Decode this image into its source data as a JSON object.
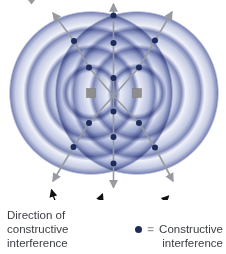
{
  "labels": {
    "direction": {
      "line1": "Direction of",
      "line2": "constructive",
      "line3": "interference"
    },
    "legend": {
      "equals": "=",
      "line1": "Constructive",
      "line2": "interference"
    }
  },
  "diagram": {
    "background": "#ffffff",
    "wave_ring_color": "#7e88b8",
    "wave_band_light": "#f0f2f9",
    "wave_band_mid": "#c3cae3",
    "arrow_color": "#979ba1",
    "annotation_color": "#111111",
    "dot_color": "#1d2b5d",
    "source_color": "#8d8d8d",
    "source_border": "#7b7b7b",
    "wave_radius": 83,
    "wave_ring_radii": [
      26,
      45,
      64,
      83
    ],
    "sources": [
      {
        "x": 91,
        "y": 93
      },
      {
        "x": 137,
        "y": 93
      }
    ],
    "constructive_dots": [
      [
        113.5,
        15.5
      ],
      [
        113.5,
        43
      ],
      [
        113.5,
        78
      ],
      [
        113.5,
        111.5
      ],
      [
        113.5,
        137
      ],
      [
        113.5,
        163.5
      ],
      [
        74,
        41
      ],
      [
        89,
        67.5
      ],
      [
        155,
        40.5
      ],
      [
        139,
        67.5
      ],
      [
        89,
        123
      ],
      [
        73.5,
        147
      ],
      [
        139,
        123
      ],
      [
        155,
        147.5
      ]
    ],
    "direction_arrows": [
      {
        "name": "vertical-arrow",
        "path": "M113.5,187.5 L113.5,4"
      },
      {
        "name": "diagonal-nw-se-arrow",
        "path": "M53,13 L74,41 L89,67.5 L113.5,96 L139,123 L155,147.5 L173,181"
      },
      {
        "name": "diagonal-ne-sw-arrow",
        "path": "M172,12 L155,40.5 L139,67.5 L113.5,96 L89,123 L73.5,147 L53,181"
      }
    ],
    "clipped_fragment_points": "28,0 35,0 31.5,4.5",
    "annotation_arrows": [
      {
        "name": "callout-to-left-arrow",
        "path": "M72,221 C63,217 56,206 51.5,190"
      },
      {
        "name": "callout-to-center-arrow",
        "path": "M74,227 C85,222 96,210 102.5,194"
      },
      {
        "name": "callout-to-right-arrow",
        "path": "M78,233 C120,230 150,215 168.5,196"
      }
    ]
  }
}
